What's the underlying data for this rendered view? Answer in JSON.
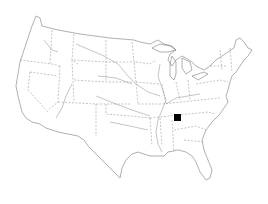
{
  "map": {
    "region": "Contiguous United States",
    "style": "outline with state borders and rivers",
    "background_color": "#ffffff",
    "line_color": "#7a7a7a"
  },
  "markers": [
    {
      "shape": "square",
      "color": "#000000",
      "x": 174,
      "y": 114,
      "size": 7,
      "approx_location": "Tennessee"
    }
  ]
}
